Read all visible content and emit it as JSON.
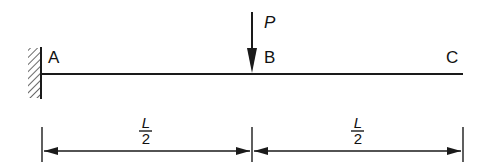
{
  "diagram": {
    "type": "cantilever-beam",
    "colors": {
      "stroke": "#1a1a1a",
      "background": "#ffffff"
    },
    "support": {
      "kind": "fixed-wall",
      "location": "A"
    },
    "points": [
      {
        "id": "A",
        "label": "A"
      },
      {
        "id": "B",
        "label": "B"
      },
      {
        "id": "C",
        "label": "C"
      }
    ],
    "load": {
      "label": "P",
      "at": "B",
      "direction": "down"
    },
    "dimensions": [
      {
        "from": "A",
        "to": "B",
        "numerator": "L",
        "denominator": "2"
      },
      {
        "from": "B",
        "to": "C",
        "numerator": "L",
        "denominator": "2"
      }
    ]
  }
}
